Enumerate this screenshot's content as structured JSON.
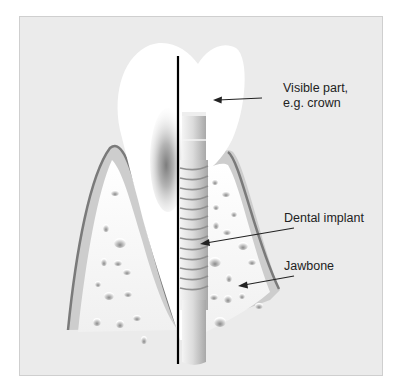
{
  "figure": {
    "colors": {
      "background": "#ebebeb",
      "frame_border": "#cfcfcf",
      "crown": "#ffffff",
      "gum_outline": "#7a7a7a",
      "gum_band": "#cdcdcd",
      "bone": "#f7f7f7",
      "implant": "#d2d2d2",
      "divider_line": "#000000",
      "text": "#222222"
    }
  },
  "labels": {
    "crown": {
      "line1": "Visible part,",
      "line2": "e.g. crown"
    },
    "implant": "Dental implant",
    "jawbone": "Jawbone"
  }
}
